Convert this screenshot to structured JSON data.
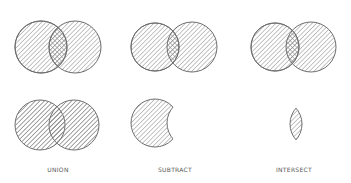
{
  "colors": {
    "background": "#ffffff",
    "stroke": "#6e6e6e",
    "hatch": "#8a8a8a",
    "label": "#555555"
  },
  "top_row": [
    {
      "name": "venn-pair-1",
      "left": {
        "cx": 41,
        "cy": 47,
        "r": 26
      },
      "right": {
        "cx": 75,
        "cy": 47,
        "r": 26
      }
    },
    {
      "name": "venn-pair-2",
      "left": {
        "cx": 155,
        "cy": 47,
        "r": 24
      },
      "right": {
        "cx": 192,
        "cy": 47,
        "r": 25
      }
    },
    {
      "name": "venn-pair-3",
      "left": {
        "cx": 275,
        "cy": 47,
        "r": 24
      },
      "right": {
        "cx": 311,
        "cy": 47,
        "r": 25
      }
    }
  ],
  "operations": [
    {
      "id": "union",
      "label": "Union",
      "label_x": 58
    },
    {
      "id": "subtract",
      "label": "Subtract",
      "label_x": 175
    },
    {
      "id": "intersect",
      "label": "Intersect",
      "label_x": 294
    }
  ]
}
